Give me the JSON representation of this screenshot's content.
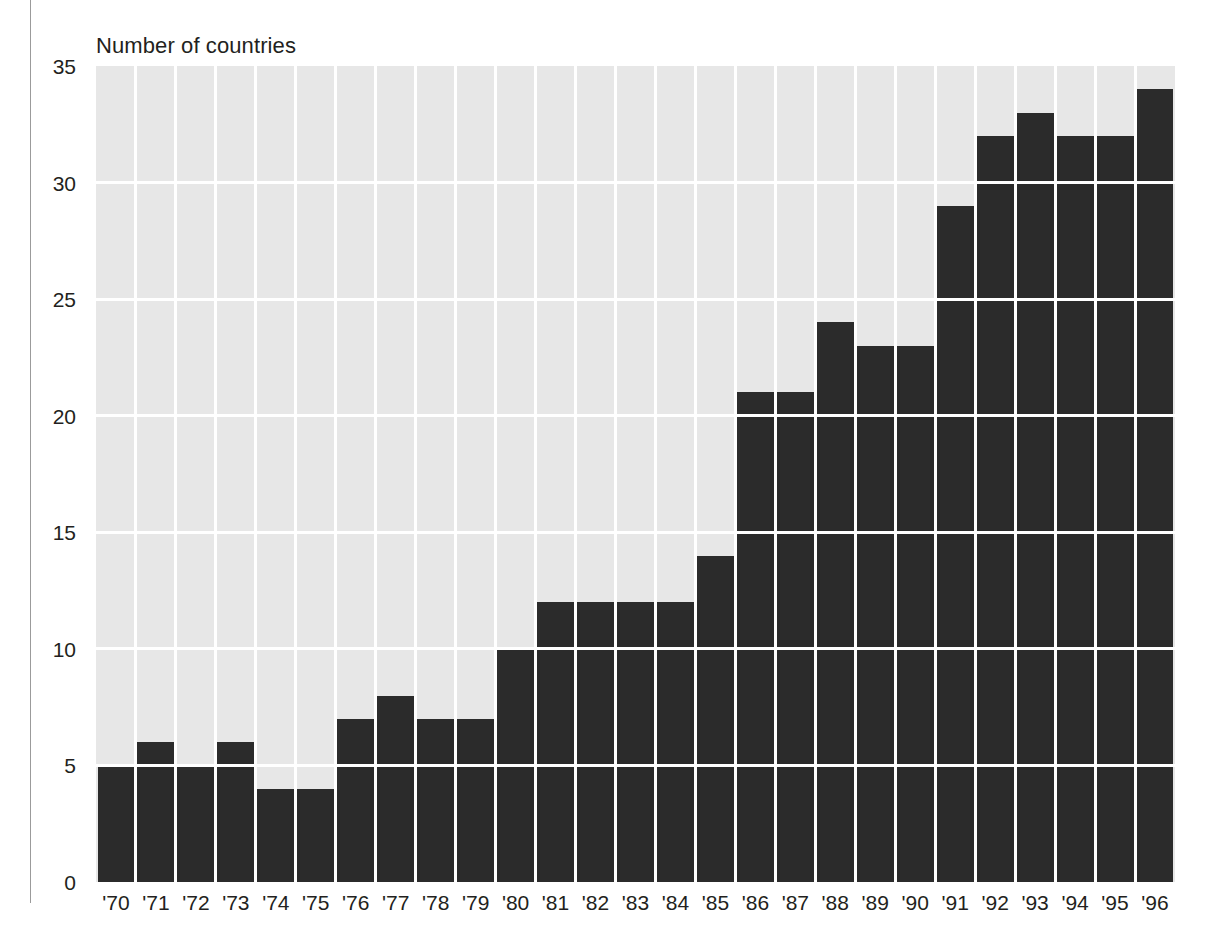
{
  "chart_data": {
    "type": "bar",
    "title": "Number of countries",
    "subtitle": "",
    "xlabel": "",
    "ylabel": "Number of countries",
    "ylim": [
      0,
      35
    ],
    "ytick_labels": [
      "0",
      "5",
      "10",
      "15",
      "20",
      "25",
      "30",
      "35"
    ],
    "ytick_values": [
      0,
      5,
      10,
      15,
      20,
      25,
      30,
      35
    ],
    "grid": "horizontal-and-vertical",
    "legend": "none",
    "categories": [
      "'70",
      "'71",
      "'72",
      "'73",
      "'74",
      "'75",
      "'76",
      "'77",
      "'78",
      "'79",
      "'80",
      "'81",
      "'82",
      "'83",
      "'84",
      "'85",
      "'86",
      "'87",
      "'88",
      "'89",
      "'90",
      "'91",
      "'92",
      "'93",
      "'94",
      "'95",
      "'96"
    ],
    "values": [
      5,
      6,
      5,
      6,
      4,
      4,
      7,
      8,
      7,
      7,
      10,
      12,
      12,
      12,
      12,
      14,
      21,
      21,
      24,
      23,
      23,
      29,
      32,
      33,
      32,
      32,
      34
    ],
    "bar_color": "#2b2b2b",
    "plot_background": "#e7e7e7",
    "gridline_color": "#ffffff",
    "text_color": "#231f20"
  }
}
